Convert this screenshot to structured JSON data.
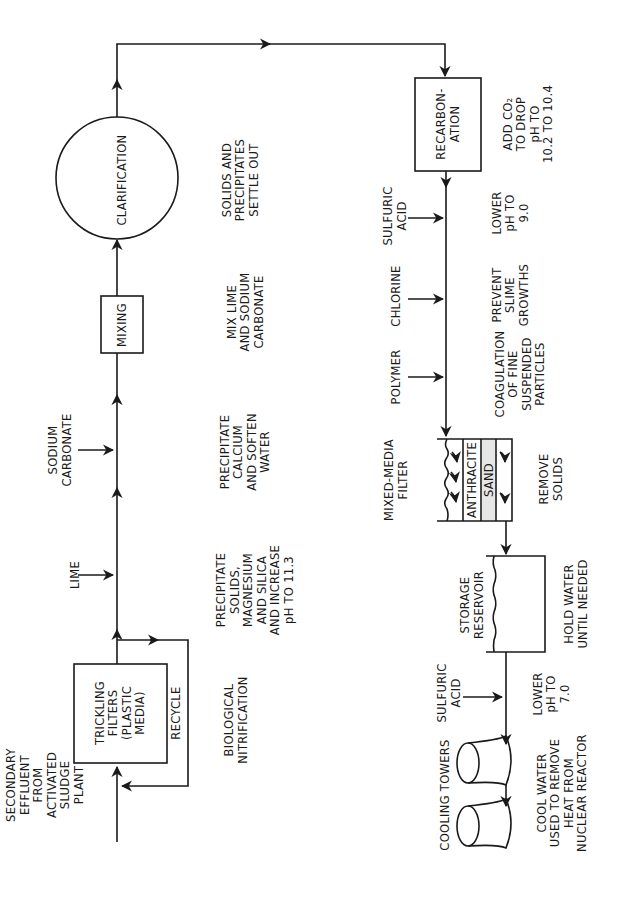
{
  "diagram": {
    "orientation": "rotated-90-ccw",
    "stroke_color": "#1a1a1a",
    "background": "#ffffff",
    "stages": [
      {
        "id": "input",
        "label": [
          "SECONDARY",
          "EFFLUENT",
          "FROM",
          "ACTIVATED",
          "SLUDGE",
          "PLANT"
        ]
      },
      {
        "id": "trickling-filters",
        "shape": "box",
        "label": [
          "TRICKLING",
          "FILTERS",
          "(PLASTIC",
          "MEDIA)"
        ],
        "note": [
          "BIOLOGICAL",
          "NITRIFICATION"
        ]
      },
      {
        "id": "recycle",
        "label": [
          "RECYCLE"
        ]
      },
      {
        "id": "lime",
        "label": [
          "LIME"
        ],
        "note": [
          "PRECIPITATE",
          "SOLIDS,",
          "MAGNESIUM",
          "AND SILICA",
          "AND INCREASE",
          "pH TO 11.3"
        ]
      },
      {
        "id": "sodium-carbonate",
        "label": [
          "SODIUM",
          "CARBONATE"
        ],
        "note": [
          "PRECIPITATE",
          "CALCIUM",
          "AND SOFTEN",
          "WATER"
        ]
      },
      {
        "id": "mixing",
        "shape": "box",
        "label": [
          "MIXING"
        ],
        "note": [
          "MIX LIME",
          "AND SODIUM",
          "CARBONATE"
        ]
      },
      {
        "id": "clarification",
        "shape": "circle",
        "label": [
          "CLARIFICATION"
        ],
        "note": [
          "SOLIDS AND",
          "PRECIPITATES",
          "SETTLE OUT"
        ]
      },
      {
        "id": "recarbonation",
        "shape": "box",
        "label": [
          "RECARBON-",
          "ATION"
        ],
        "note": [
          "ADD CO₂",
          "TO DROP",
          "pH TO",
          "10.2 TO 10.4"
        ]
      },
      {
        "id": "sulfuric-acid-1",
        "label": [
          "SULFURIC",
          "ACID"
        ],
        "note": [
          "LOWER",
          "pH TO",
          "9.0"
        ]
      },
      {
        "id": "chlorine",
        "label": [
          "CHLORINE"
        ],
        "note": [
          "PREVENT",
          "SLIME",
          "GROWTHS"
        ]
      },
      {
        "id": "polymer",
        "label": [
          "POLYMER"
        ],
        "note": [
          "COAGULATION",
          "OF FINE",
          "SUSPENDED",
          "PARTICLES"
        ]
      },
      {
        "id": "mixed-media-filter",
        "shape": "filter",
        "label": [
          "MIXED-MEDIA",
          "FILTER"
        ],
        "layers": [
          "ANTHRACITE",
          "SAND"
        ],
        "note": [
          "REMOVE",
          "SOLIDS"
        ]
      },
      {
        "id": "storage-reservoir",
        "shape": "tank",
        "label": [
          "STORAGE",
          "RESERVOIR"
        ],
        "note": [
          "HOLD WATER",
          "UNTIL NEEDED"
        ]
      },
      {
        "id": "sulfuric-acid-2",
        "label": [
          "SULFURIC",
          "ACID"
        ],
        "note": [
          "LOWER",
          "pH TO",
          "7.0"
        ]
      },
      {
        "id": "cooling-towers",
        "shape": "towers",
        "label": [
          "COOLING TOWERS"
        ],
        "note": [
          "COOL WATER",
          "USED TO REMOVE",
          "HEAT FROM",
          "NUCLEAR REACTOR"
        ]
      }
    ]
  }
}
